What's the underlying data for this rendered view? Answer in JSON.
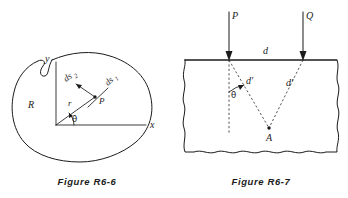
{
  "figures": [
    {
      "id": "figure-r6-6",
      "caption": "Figure R6-6",
      "description": "Closed plane region R in the xy-plane with interior point P, radius vector r at angle theta, and two perpendicular line elements ds1 and ds2",
      "labels": {
        "y_axis": "y",
        "x_axis": "x",
        "region": "R",
        "radius": "r",
        "point": "P",
        "angle": "θ",
        "element_1_base": "ds",
        "element_1_sub": "1",
        "element_2_base": "ds",
        "element_2_sub": "2"
      }
    },
    {
      "id": "figure-r6-7",
      "caption": "Figure R6-7",
      "description": "Elastic half-plane loaded by two vertical point forces P and Q separated by distance d, with slant distances d-prime to interior point A and angle theta from the vertical",
      "labels": {
        "load_left": "P",
        "load_right": "Q",
        "surface_distance": "d",
        "slant_left": "d′",
        "slant_right": "d′",
        "angle": "θ",
        "point": "A"
      }
    }
  ],
  "colors": {
    "ink": "#1b1b1b",
    "dashed": "#2a2a2a",
    "background": "#ffffff"
  }
}
